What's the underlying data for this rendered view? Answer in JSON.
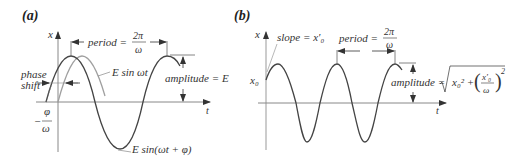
{
  "panels": [
    {
      "id": "a",
      "label": "(a)",
      "axes": {
        "y_label": "x",
        "x_label": "t"
      },
      "annotations": {
        "period_label": "period = ",
        "period_num": "2π",
        "period_den": "ω",
        "amplitude_label": "amplitude = E",
        "phase_shift_line1": "phase",
        "phase_shift_line2": "shift",
        "offset_sign": "−",
        "offset_num": "φ",
        "offset_den": "ω",
        "reference_curve_label": "E sin ωt",
        "shifted_curve_label": "E sin(ωt + φ)"
      },
      "colors": {
        "shifted_curve": "#444444",
        "reference_curve": "#9a9a9a",
        "axes": "#777777"
      }
    },
    {
      "id": "b",
      "label": "(b)",
      "axes": {
        "y_label": "x",
        "x_label": "t",
        "y_tick": "x₀"
      },
      "annotations": {
        "slope_label": "slope = x′₀",
        "period_label": "period = ",
        "period_num": "2π",
        "period_den": "ω",
        "amplitude_label": "amplitude = ",
        "amplitude_formula_a": "x₀² + ",
        "amplitude_frac_num": "x′₀",
        "amplitude_frac_den": "ω",
        "amplitude_exp": "2"
      },
      "colors": {
        "curve": "#444444",
        "axes": "#777777"
      }
    }
  ]
}
